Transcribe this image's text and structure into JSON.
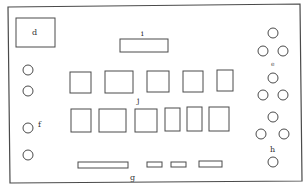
{
  "diagram": {
    "type": "layout-schematic",
    "stroke_color": "#4a4a4a",
    "background": "#ffffff",
    "frame": {
      "points": [
        [
          8,
          7
        ],
        [
          300,
          4
        ],
        [
          302,
          181
        ],
        [
          10,
          183
        ]
      ]
    },
    "labels": {
      "d": "d",
      "i": "i",
      "j": "j",
      "e": "e",
      "f": "f",
      "g": "g",
      "h": "h"
    },
    "box_d": {
      "x": 16,
      "y": 18,
      "w": 39,
      "h": 29
    },
    "box_i": {
      "x": 120,
      "y": 39,
      "w": 48,
      "h": 13
    },
    "group_j": {
      "row1": [
        {
          "x": 70,
          "y": 72,
          "w": 21,
          "h": 21
        },
        {
          "x": 105,
          "y": 71,
          "w": 28,
          "h": 22
        },
        {
          "x": 147,
          "y": 71,
          "w": 22,
          "h": 21
        },
        {
          "x": 183,
          "y": 71,
          "w": 20,
          "h": 21
        },
        {
          "x": 217,
          "y": 70,
          "w": 16,
          "h": 21
        }
      ],
      "row2": [
        {
          "x": 71,
          "y": 109,
          "w": 20,
          "h": 23
        },
        {
          "x": 99,
          "y": 109,
          "w": 27,
          "h": 23
        },
        {
          "x": 135,
          "y": 109,
          "w": 22,
          "h": 23
        },
        {
          "x": 165,
          "y": 108,
          "w": 15,
          "h": 23
        },
        {
          "x": 187,
          "y": 107,
          "w": 15,
          "h": 24
        },
        {
          "x": 209,
          "y": 107,
          "w": 20,
          "h": 24
        }
      ]
    },
    "group_e": [
      {
        "cx": 273,
        "cy": 33,
        "r": 5
      },
      {
        "cx": 263,
        "cy": 51,
        "r": 5
      },
      {
        "cx": 283,
        "cy": 51,
        "r": 5
      },
      {
        "cx": 273,
        "cy": 78,
        "r": 5
      },
      {
        "cx": 263,
        "cy": 95,
        "r": 5
      },
      {
        "cx": 283,
        "cy": 95,
        "r": 5
      }
    ],
    "group_h": [
      {
        "cx": 273,
        "cy": 117,
        "r": 5
      },
      {
        "cx": 261,
        "cy": 134,
        "r": 5
      },
      {
        "cx": 284,
        "cy": 134,
        "r": 5
      },
      {
        "cx": 273,
        "cy": 162,
        "r": 5
      }
    ],
    "group_f": [
      {
        "cx": 28,
        "cy": 70,
        "r": 5
      },
      {
        "cx": 28,
        "cy": 91,
        "r": 5
      },
      {
        "cx": 28,
        "cy": 128,
        "r": 5
      },
      {
        "cx": 28,
        "cy": 155,
        "r": 5
      }
    ],
    "group_g": [
      {
        "x": 78,
        "y": 162,
        "w": 50,
        "h": 6
      },
      {
        "x": 147,
        "y": 162,
        "w": 15,
        "h": 5
      },
      {
        "x": 171,
        "y": 162,
        "w": 15,
        "h": 5
      },
      {
        "x": 199,
        "y": 161,
        "w": 23,
        "h": 6
      }
    ]
  }
}
